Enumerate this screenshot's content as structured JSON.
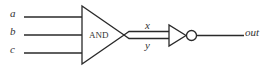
{
  "diagram": {
    "type": "logic-circuit",
    "inputs": [
      {
        "label": "a"
      },
      {
        "label": "b"
      },
      {
        "label": "c"
      }
    ],
    "gates": [
      {
        "id": "and1",
        "type": "AND",
        "label": "AND"
      },
      {
        "id": "not1",
        "type": "NOT",
        "label": ""
      }
    ],
    "intermediate_wires": [
      {
        "label": "x"
      },
      {
        "label": "y"
      }
    ],
    "output": {
      "label": "out"
    },
    "colors": {
      "stroke": "#2a2a2a",
      "text": "#333333",
      "background": "#ffffff"
    }
  }
}
